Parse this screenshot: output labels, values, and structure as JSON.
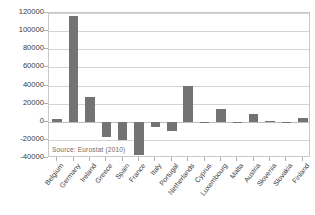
{
  "chart_data": {
    "type": "bar",
    "title": "",
    "subtitle": "",
    "xlabel": "",
    "ylabel": "",
    "ylim": [
      -40000,
      120000
    ],
    "ytick_step": 20000,
    "grid": true,
    "legend": false,
    "legend_position": "none",
    "annotation": "Source:  Eurostat (2010)",
    "bar_color": "#737373",
    "gridline_color": "#d4d4d4",
    "axis_color": "#c8c8c8",
    "plot_background": "#ffffff",
    "categories": [
      "Belgium",
      "Germany",
      "Ireland",
      "Greece",
      "Spain",
      "France",
      "Italy",
      "Portugal",
      "Netherlands",
      "Cyprus",
      "Luxembourg",
      "Malta",
      "Austria",
      "Slovenia",
      "Slovakia",
      "Finland"
    ],
    "values": [
      3500,
      117000,
      27000,
      -17000,
      -20000,
      -37000,
      -6000,
      -10000,
      40000,
      200,
      14000,
      -300,
      9000,
      1200,
      -600,
      4500
    ],
    "ytick_labels": [
      "120000",
      "100000",
      "80000",
      "60000",
      "40000",
      "20000",
      "0",
      "-20000",
      "-40000"
    ],
    "ytick_values": [
      120000,
      100000,
      80000,
      60000,
      40000,
      20000,
      0,
      -20000,
      -40000
    ]
  }
}
